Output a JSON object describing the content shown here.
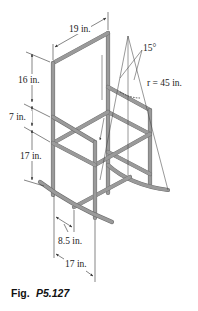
{
  "figure": {
    "caption_prefix": "Fig.",
    "caption_number": "P5.127",
    "tube_color": "#9a9a9a",
    "line_color": "#333333"
  },
  "dimensions": {
    "back_width": "19 in.",
    "back_height": "16 in.",
    "arm_height": "7 in.",
    "seat_height": "17 in.",
    "half_depth": "8.5 in.",
    "depth": "17 in.",
    "angle": "15°",
    "radius": "r = 45 in."
  }
}
